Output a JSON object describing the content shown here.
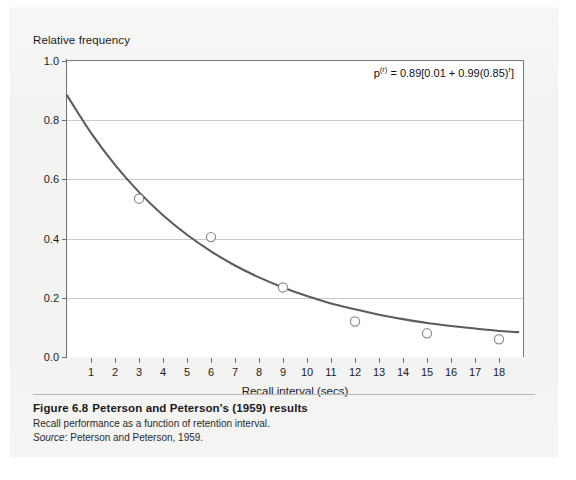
{
  "figure": {
    "caption_label": "Figure 6.8",
    "caption_title": "Peterson and Peterson's (1959) results",
    "caption_subtitle": "Recall performance as a function of retention interval.",
    "source_label": "Source",
    "source_text": ": Peterson and Peterson, 1959."
  },
  "annotation": {
    "equation_prefix": "p",
    "equation_prefix_sup": "(r)",
    "equation_body": " = 0.89[0.01 + 0.99(0.85)",
    "equation_sup": "r",
    "equation_suffix": "]"
  },
  "colors": {
    "curve": "#5c5c5c",
    "marker_stroke": "#8a8a8a",
    "gridline": "#c9c9c9",
    "axis": "#6f6f6f",
    "page_background": "#f3f3f2",
    "plot_background": "#ffffff",
    "text": "#1b1b1b"
  },
  "chart_data": {
    "type": "line",
    "title": "",
    "subtitle": "",
    "xlabel": "Recall interval (secs)",
    "ylabel": "Relative frequency",
    "xlim": [
      0,
      19
    ],
    "ylim": [
      0.0,
      1.0
    ],
    "grid": true,
    "legend_position": "none",
    "yticks": [
      0.0,
      0.2,
      0.4,
      0.6,
      0.8,
      1.0
    ],
    "ytick_labels": [
      "0.0",
      "0.2",
      "0.4",
      "0.6",
      "0.8",
      "1.0"
    ],
    "xticks": [
      1,
      2,
      3,
      4,
      5,
      6,
      7,
      8,
      9,
      10,
      11,
      12,
      13,
      14,
      15,
      16,
      17,
      18
    ],
    "xtick_labels": [
      "1",
      "2",
      "3",
      "4",
      "5",
      "6",
      "7",
      "8",
      "9",
      "10",
      "11",
      "12",
      "13",
      "14",
      "15",
      "16",
      "17",
      "18"
    ],
    "series": [
      {
        "name": "Fitted curve",
        "type": "line",
        "marker": "none",
        "x": [
          0,
          1,
          2,
          3,
          4,
          5,
          6,
          7,
          8,
          9,
          10,
          11,
          12,
          13,
          14,
          15,
          16,
          17,
          18,
          18.8
        ],
        "y": [
          0.884,
          0.757,
          0.649,
          0.557,
          0.479,
          0.413,
          0.357,
          0.309,
          0.269,
          0.235,
          0.206,
          0.181,
          0.161,
          0.143,
          0.128,
          0.115,
          0.105,
          0.096,
          0.088,
          0.084
        ]
      },
      {
        "name": "Observed data",
        "type": "scatter",
        "marker": "open-circle",
        "x": [
          3,
          6,
          9,
          12,
          15,
          18
        ],
        "y": [
          0.535,
          0.405,
          0.235,
          0.12,
          0.08,
          0.06
        ]
      }
    ],
    "annotations": [
      {
        "text": "p(r) = 0.89[0.01 + 0.99(0.85)r]",
        "position": "top-right"
      }
    ]
  }
}
